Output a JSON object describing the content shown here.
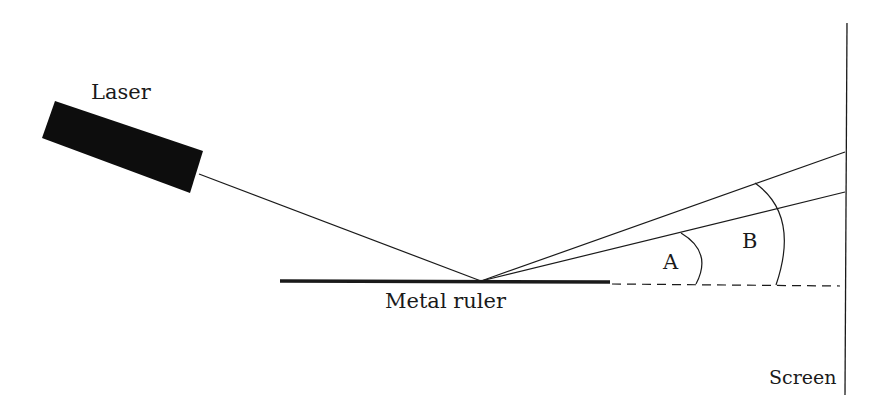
{
  "diagram": {
    "labels": {
      "laser": "Laser",
      "ruler": "Metal ruler",
      "screen": "Screen",
      "angle_a": "A",
      "angle_b": "B"
    },
    "colors": {
      "ink": "#1a1a1a",
      "laser_body": "#0d0d0d",
      "background": "#ffffff"
    }
  }
}
